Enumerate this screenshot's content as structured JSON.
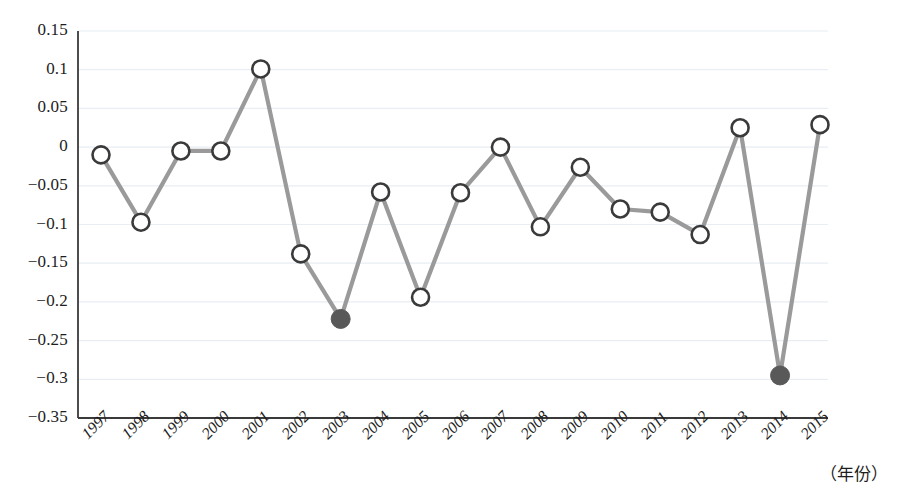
{
  "chart_data": {
    "type": "line",
    "title": "",
    "xlabel": "（年份）",
    "ylabel": "",
    "categories": [
      "1997",
      "1998",
      "1999",
      "2000",
      "2001",
      "2002",
      "2003",
      "2004",
      "2005",
      "2006",
      "2007",
      "2008",
      "2009",
      "2010",
      "2011",
      "2012",
      "2013",
      "2014",
      "2015"
    ],
    "values": [
      -0.01,
      -0.097,
      -0.005,
      -0.005,
      0.101,
      -0.138,
      -0.222,
      -0.058,
      -0.194,
      -0.059,
      0.0,
      -0.103,
      -0.026,
      -0.08,
      -0.084,
      -0.113,
      0.025,
      -0.295,
      0.029
    ],
    "highlighted_points": [
      {
        "category": "2003",
        "value": -0.222
      },
      {
        "category": "2014",
        "value": -0.295
      }
    ],
    "ylim": [
      -0.35,
      0.15
    ],
    "yticks": [
      "0.15",
      "0.1",
      "0.05",
      "0",
      "−0.05",
      "−0.1",
      "−0.15",
      "−0.2",
      "−0.25",
      "−0.3",
      "−0.35"
    ],
    "ytick_values": [
      0.15,
      0.1,
      0.05,
      0,
      -0.05,
      -0.1,
      -0.15,
      -0.2,
      -0.25,
      -0.3,
      -0.35
    ],
    "grid": true,
    "legend": "none",
    "colors": {
      "line": "#9a9a9a",
      "marker_stroke": "#3a3a3a",
      "marker_fill": "#ffffff",
      "marker_highlight_fill": "#595959",
      "axis": "#3a3a3a",
      "grid": "#e8eef3",
      "text": "#1d1d1d"
    }
  }
}
